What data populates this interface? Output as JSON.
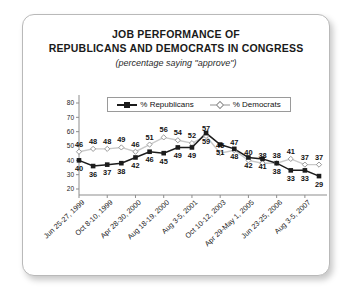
{
  "figure": {
    "title_line_1": "JOB PERFORMANCE OF",
    "title_line_2": "REPUBLICANS AND DEMOCRATS IN CONGRESS",
    "subtitle": "(percentage saying \"approve\")"
  },
  "legend": {
    "position": "top-inside",
    "entries": [
      {
        "label": "% Republicans",
        "marker": "filled-square",
        "color": "#1c1c1c"
      },
      {
        "label": "% Democrats",
        "marker": "open-diamond",
        "color": "#c9c9c9"
      }
    ]
  },
  "chart_data": {
    "type": "line",
    "title": "JOB PERFORMANCE OF REPUBLICANS AND DEMOCRATS IN CONGRESS",
    "subtitle": "(percentage saying \"approve\")",
    "xlabel": "",
    "ylabel": "",
    "ylim": [
      20,
      80
    ],
    "yticks": [
      20,
      30,
      40,
      50,
      60,
      70,
      80
    ],
    "grid": false,
    "x_tick_labels": [
      "Jun 25-27, 1999",
      "Oct 8-10, 1999",
      "Apr 28-30, 2000",
      "Aug 18-19, 2000",
      "Aug 3-5, 2001",
      "Oct 10-12, 2003",
      "Apr 29-May 1, 2005",
      "Jun 23-25, 2006",
      "Aug 3-5, 2007"
    ],
    "x_tick_indices": [
      0,
      2,
      4,
      6,
      8,
      10,
      12,
      14,
      16
    ],
    "n_points": 18,
    "series": [
      {
        "name": "% Republicans",
        "color": "#1c1c1c",
        "values": [
          40,
          36,
          37,
          38,
          42,
          46,
          45,
          49,
          49,
          59,
          51,
          48,
          42,
          41,
          38,
          33,
          33,
          29
        ]
      },
      {
        "name": "% Democrats",
        "color": "#c9c9c9",
        "values": [
          46,
          48,
          48,
          49,
          46,
          51,
          56,
          54,
          52,
          57,
          45,
          47,
          40,
          38,
          38,
          41,
          37,
          37
        ]
      }
    ]
  }
}
